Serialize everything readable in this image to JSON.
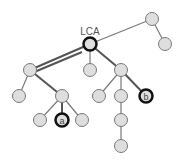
{
  "diagram": {
    "lca_label": "LCA",
    "node_a_label": "a",
    "node_b_label": "b",
    "colors": {
      "node_fill": "#dedede",
      "node_stroke": "#7a7a7a",
      "highlight_stroke": "#111111",
      "edge": "#777777",
      "path_edge": "#555555",
      "label": "#555555"
    }
  }
}
